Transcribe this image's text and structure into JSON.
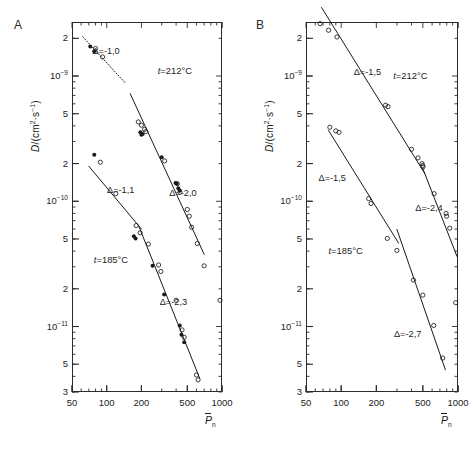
{
  "figure": {
    "panels": [
      {
        "letter": "A",
        "ylabel_parts": {
          "d": "D",
          "slash": "/(cm",
          "sup2": "2",
          "mid": "·s",
          "supm1": "-1",
          "close": ")"
        },
        "ylabel_text": "D/(cm2·s-1)",
        "xlabel": "P̄n",
        "xlabel_base": "P",
        "xlabel_sub": "n",
        "y_ticks": [
          {
            "label": "2",
            "sup": "",
            "value": 2e-09
          },
          {
            "label": "10",
            "sup": "-9",
            "value": 1e-09
          },
          {
            "label": "5",
            "sup": "",
            "value": 5e-10
          },
          {
            "label": "2",
            "sup": "",
            "value": 2e-10
          },
          {
            "label": "10",
            "sup": "-10",
            "value": 1e-10
          },
          {
            "label": "5",
            "sup": "",
            "value": 5e-11
          },
          {
            "label": "2",
            "sup": "",
            "value": 2e-11
          },
          {
            "label": "10",
            "sup": "-11",
            "value": 1e-11
          },
          {
            "label": "5",
            "sup": "",
            "value": 5e-12
          },
          {
            "label": "3",
            "sup": "",
            "value": 3e-12
          }
        ],
        "x_ticks": [
          {
            "label": "50",
            "value": 50
          },
          {
            "label": "100",
            "value": 100
          },
          {
            "label": "200",
            "value": 200
          },
          {
            "label": "500",
            "value": 500
          },
          {
            "label": "1000",
            "value": 1000
          }
        ],
        "temperature_labels": [
          {
            "text": "t=212°C",
            "x": 430,
            "y": 1.1e-09
          },
          {
            "text": "t=185°C",
            "x": 120,
            "y": 3.4e-11
          }
        ],
        "slope_labels": [
          {
            "text": "Δ=-1,0",
            "x": 112,
            "y": 1.55e-09
          },
          {
            "text": "Δ=-1,1",
            "x": 150,
            "y": 1.2e-10
          },
          {
            "text": "Δ=-2,0",
            "x": 520,
            "y": 1.15e-10
          },
          {
            "text": "Δ=-2,3",
            "x": 430,
            "y": 1.55e-11
          }
        ]
      },
      {
        "letter": "B",
        "ylabel_text": "D/(cm2·s-1)",
        "xlabel_base": "P",
        "xlabel_sub": "n",
        "y_ticks": [
          {
            "label": "2",
            "sup": "",
            "value": 2e-09
          },
          {
            "label": "10",
            "sup": "-9",
            "value": 1e-09
          },
          {
            "label": "5",
            "sup": "",
            "value": 5e-10
          },
          {
            "label": "2",
            "sup": "",
            "value": 2e-10
          },
          {
            "label": "10",
            "sup": "-10",
            "value": 1e-10
          },
          {
            "label": "5",
            "sup": "",
            "value": 5e-11
          },
          {
            "label": "2",
            "sup": "",
            "value": 2e-11
          },
          {
            "label": "10",
            "sup": "-11",
            "value": 1e-11
          },
          {
            "label": "5",
            "sup": "",
            "value": 5e-12
          },
          {
            "label": "3",
            "sup": "",
            "value": 3e-12
          }
        ],
        "x_ticks": [
          {
            "label": "50",
            "value": 50
          },
          {
            "label": "100",
            "value": 100
          },
          {
            "label": "200",
            "value": 200
          },
          {
            "label": "500",
            "value": 500
          },
          {
            "label": "1000",
            "value": 1000
          }
        ],
        "temperature_labels": [
          {
            "text": "t=212°C",
            "x": 430,
            "y": 1e-09
          },
          {
            "text": "t=185°C",
            "x": 120,
            "y": 4e-11
          }
        ],
        "slope_labels": [
          {
            "text": "Δ=-1,5",
            "x": 190,
            "y": 1.05e-09
          },
          {
            "text": "Δ=-1,5",
            "x": 95,
            "y": 1.5e-10
          },
          {
            "text": "Δ=-2,4",
            "x": 640,
            "y": 8.6e-11
          },
          {
            "text": "Δ=-2,7",
            "x": 420,
            "y": 8.5e-12
          }
        ]
      }
    ]
  },
  "chart_data": {
    "type": "scatter",
    "title": "",
    "n_panels": 2,
    "axes": {
      "xlabel": "P̄n",
      "ylabel": "D/(cm²·s⁻¹)",
      "xscale": "log",
      "yscale": "log",
      "xlim": [
        50,
        1000
      ],
      "ylim": [
        3e-12,
        2.7e-09
      ],
      "grid": false,
      "legend": "none"
    },
    "panels": [
      {
        "label": "A",
        "series": [
          {
            "name": "t=212°C filled",
            "marker": "filled-circle",
            "temperature": "212°C",
            "points": [
              [
                72,
                1.72e-09
              ],
              [
                78,
                1.58e-09
              ],
              [
                196,
                3.55e-10
              ],
              [
                200,
                3.4e-10
              ],
              [
                205,
                3.45e-10
              ],
              [
                300,
                2.25e-10
              ],
              [
                395,
                1.4e-10
              ],
              [
                405,
                1.38e-10
              ],
              [
                418,
                1.27e-10
              ],
              [
                430,
                1.22e-10
              ]
            ]
          },
          {
            "name": "t=212°C open",
            "marker": "open-circle",
            "temperature": "212°C",
            "points": [
              [
                80,
                1.66e-09
              ],
              [
                92,
                1.42e-09
              ],
              [
                188,
                4.3e-10
              ],
              [
                200,
                4.05e-10
              ],
              [
                213,
                3.75e-10
              ],
              [
                218,
                3.6e-10
              ],
              [
                318,
                2.1e-10
              ],
              [
                410,
                1.38e-10
              ],
              [
                432,
                1.18e-10
              ],
              [
                500,
                8.6e-11
              ],
              [
                520,
                7.6e-11
              ],
              [
                545,
                6.2e-11
              ],
              [
                610,
                4.6e-11
              ],
              [
                700,
                3.05e-11
              ],
              [
                960,
                1.62e-11
              ]
            ]
          },
          {
            "name": "t=185°C filled",
            "marker": "filled-circle",
            "temperature": "185°C",
            "points": [
              [
                78,
                2.35e-10
              ],
              [
                172,
                5.25e-11
              ],
              [
                178,
                5.05e-11
              ],
              [
                250,
                3.05e-11
              ],
              [
                315,
                1.8e-11
              ],
              [
                430,
                1.02e-11
              ],
              [
                445,
                8.6e-12
              ],
              [
                470,
                7.5e-12
              ]
            ]
          },
          {
            "name": "t=185°C open",
            "marker": "open-circle",
            "temperature": "185°C",
            "points": [
              [
                88,
                2.05e-10
              ],
              [
                120,
                1.15e-10
              ],
              [
                180,
                6.4e-11
              ],
              [
                195,
                5.6e-11
              ],
              [
                230,
                4.55e-11
              ],
              [
                282,
                3.1e-11
              ],
              [
                295,
                2.75e-11
              ],
              [
                400,
                1.62e-11
              ],
              [
                450,
                9.4e-12
              ],
              [
                470,
                8.2e-12
              ],
              [
                600,
                4.1e-12
              ],
              [
                620,
                3.75e-12
              ]
            ]
          }
        ],
        "fit_lines": [
          {
            "slope": -1.0,
            "label": "Δ=-1,0",
            "x_range": [
              62,
              145
            ],
            "temperature": "212°C",
            "style": "dotted"
          },
          {
            "slope": -2.0,
            "label": "Δ=-2,0",
            "x_range": [
              160,
              700
            ],
            "temperature": "212°C",
            "style": "solid"
          },
          {
            "slope": -1.1,
            "label": "Δ=-1,1",
            "x_range": [
              70,
              200
            ],
            "temperature": "185°C",
            "style": "solid"
          },
          {
            "slope": -2.3,
            "label": "Δ=-2,3",
            "x_range": [
              190,
              640
            ],
            "temperature": "185°C",
            "style": "solid"
          }
        ]
      },
      {
        "label": "B",
        "series": [
          {
            "name": "t=212°C",
            "marker": "open-circle",
            "temperature": "212°C",
            "points": [
              [
                66,
                2.62e-09
              ],
              [
                78,
                2.32e-09
              ],
              [
                92,
                2.05e-09
              ],
              [
                240,
                5.85e-10
              ],
              [
                252,
                5.7e-10
              ],
              [
                400,
                2.6e-10
              ],
              [
                455,
                2.22e-10
              ],
              [
                492,
                2e-10
              ],
              [
                498,
                1.93e-10
              ],
              [
                502,
                1.88e-10
              ],
              [
                625,
                1.15e-10
              ],
              [
                790,
                8e-11
              ],
              [
                800,
                7.6e-11
              ],
              [
                850,
                6.1e-11
              ],
              [
                955,
                1.55e-11
              ]
            ]
          },
          {
            "name": "t=185°C",
            "marker": "open-circle",
            "temperature": "185°C",
            "points": [
              [
                80,
                3.9e-10
              ],
              [
                90,
                3.65e-10
              ],
              [
                96,
                3.55e-10
              ],
              [
                172,
                1.05e-10
              ],
              [
                180,
                9.6e-11
              ],
              [
                248,
                5.05e-11
              ],
              [
                300,
                4.05e-11
              ],
              [
                415,
                2.35e-11
              ],
              [
                500,
                1.78e-11
              ],
              [
                620,
                1.02e-11
              ],
              [
                740,
                5.6e-12
              ]
            ]
          }
        ],
        "fit_lines": [
          {
            "slope": -1.5,
            "label": "Δ=-1,5",
            "x_range": [
              68,
              520
            ],
            "temperature": "212°C",
            "style": "solid"
          },
          {
            "slope": -2.4,
            "label": "Δ=-2,4",
            "x_range": [
              500,
              980
            ],
            "temperature": "212°C",
            "style": "solid"
          },
          {
            "slope": -1.5,
            "label": "Δ=-1,5",
            "x_range": [
              78,
              310
            ],
            "temperature": "185°C",
            "style": "solid"
          },
          {
            "slope": -2.7,
            "label": "Δ=-2,7",
            "x_range": [
              300,
              780
            ],
            "temperature": "185°C",
            "style": "solid"
          }
        ]
      }
    ]
  },
  "colors": {
    "axis": "#2b2b2b",
    "marker": "#1a1a1a",
    "text": "#1d1d1d",
    "background": "#ffffff"
  }
}
